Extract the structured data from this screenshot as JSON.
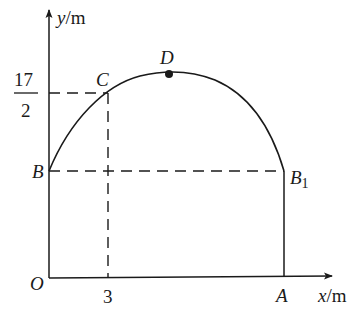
{
  "diagram": {
    "type": "coordinate-graph",
    "axes": {
      "y_label_var": "y",
      "y_label_unit": "/m",
      "x_label_var": "x",
      "x_label_unit": "/m",
      "origin_label": "O"
    },
    "points": {
      "B": {
        "label": "B"
      },
      "C": {
        "label": "C"
      },
      "D": {
        "label": "D"
      },
      "B1": {
        "label": "B",
        "subscript": "1"
      },
      "A": {
        "label": "A"
      }
    },
    "ticks": {
      "x_tick": "3",
      "y_tick_numerator": "17",
      "y_tick_denominator": "2"
    },
    "colors": {
      "stroke": "#1a1a1a",
      "background": "#ffffff"
    }
  }
}
